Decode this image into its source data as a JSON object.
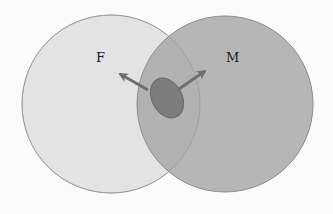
{
  "diagram": {
    "type": "venn",
    "background": "#fbfbfb",
    "sets": [
      {
        "id": "F",
        "label": "F",
        "cx": 111,
        "cy": 104,
        "r": 89,
        "fill": "#e3e3e3",
        "stroke": "#9a9a9a",
        "label_x": 96,
        "label_y": 62
      },
      {
        "id": "M",
        "label": "M",
        "cx": 225,
        "cy": 104,
        "r": 88,
        "fill": "#a9a9a9",
        "fill_opacity": 0.85,
        "stroke": "#8a8a8a",
        "label_x": 226,
        "label_y": 62
      }
    ],
    "intersection_blob": {
      "shape": "ellipse",
      "cx": 167,
      "cy": 98,
      "rx": 15,
      "ry": 21,
      "rotation_deg": -28,
      "fill": "#7d7d7d",
      "stroke": "#666666"
    },
    "arrows": [
      {
        "id": "arrow-toward-F",
        "from": [
          148,
          90
        ],
        "to": [
          120,
          74
        ],
        "color": "#6f6f6f"
      },
      {
        "id": "arrow-toward-M",
        "from": [
          179,
          89
        ],
        "to": [
          205,
          71
        ],
        "color": "#6f6f6f"
      }
    ]
  }
}
